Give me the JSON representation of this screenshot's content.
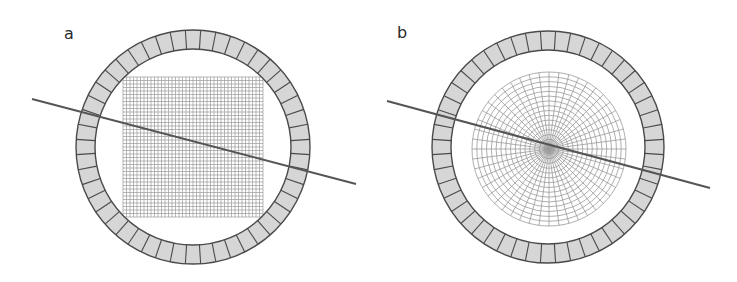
{
  "figure": {
    "width": 737,
    "height": 282,
    "colors": {
      "background": "#ffffff",
      "ring_fill": "#d6d6d6",
      "ring_stroke": "#4a4a4a",
      "grid_stroke": "#9a9a9a",
      "line_stroke": "#555555",
      "label": "#2a2a2a"
    },
    "panels": [
      {
        "id": "a",
        "label": "a",
        "label_pos": [
          64,
          26
        ],
        "ring": {
          "cx": 193,
          "cy": 147,
          "r_outer": 117,
          "r_inner": 98,
          "segments": 48
        },
        "inner_grid": {
          "type": "cartesian",
          "x": 123,
          "y": 77,
          "size": 140,
          "cells": 40
        },
        "line": {
          "x1": 32,
          "y1": 99,
          "x2": 356,
          "y2": 184
        }
      },
      {
        "id": "b",
        "label": "b",
        "label_pos": [
          397,
          25
        ],
        "ring": {
          "cx": 548,
          "cy": 147,
          "r_outer": 116,
          "r_inner": 97,
          "segments": 48
        },
        "inner_grid": {
          "type": "polar",
          "cx": 549,
          "cy": 149,
          "radius": 77,
          "rings": 16,
          "spokes": 48
        },
        "line": {
          "x1": 387,
          "y1": 101,
          "x2": 710,
          "y2": 188
        }
      }
    ]
  }
}
